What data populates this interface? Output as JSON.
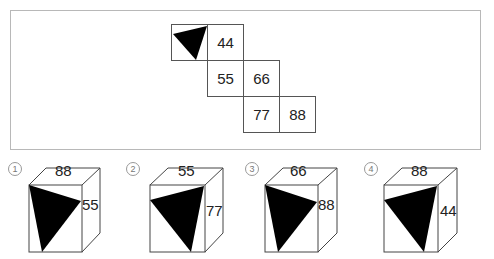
{
  "net": {
    "cells": [
      {
        "id": "triangle",
        "label": "",
        "col": 0,
        "row": 0
      },
      {
        "id": "c44",
        "label": "44",
        "col": 1,
        "row": 0
      },
      {
        "id": "c55",
        "label": "55",
        "col": 1,
        "row": 1
      },
      {
        "id": "c66",
        "label": "66",
        "col": 2,
        "row": 1
      },
      {
        "id": "c77",
        "label": "77",
        "col": 2,
        "row": 2
      },
      {
        "id": "c88",
        "label": "88",
        "col": 3,
        "row": 2
      }
    ]
  },
  "options": [
    {
      "number": "1",
      "top": "88",
      "side": "55"
    },
    {
      "number": "2",
      "top": "55",
      "side": "77"
    },
    {
      "number": "3",
      "top": "66",
      "side": "88"
    },
    {
      "number": "4",
      "top": "88",
      "side": "44"
    }
  ]
}
